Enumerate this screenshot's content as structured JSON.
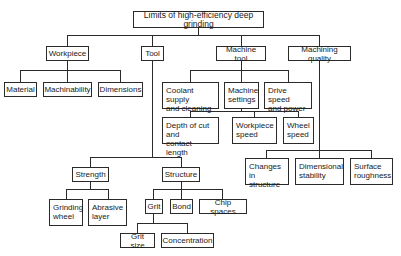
{
  "diagram": {
    "title": "Limits of high-efficiency deep grinding",
    "line_color": "#2a2a2a",
    "nodes": {
      "root": "Limits of high-efficiency deep grinding",
      "workpiece": "Workpiece",
      "tool": "Tool",
      "machine_tool": "Machine tool",
      "machining_quality": "Machining quality",
      "material": "Material",
      "machinability": "Machinability",
      "dimensions": "Dimensions",
      "coolant": "Coolant supply\nand cleaning",
      "machine_settings": "Machine\nsettings",
      "drive_speed": "Drive speed\nand power",
      "depth_of_cut": "Depth of cut and\ncontact length",
      "workpiece_speed": "Workpiece\nspeed",
      "wheel_speed": "Wheel\nspeed",
      "changes_in_structure": "Changes in\nstructure",
      "dimensional_stability": "Dimensional\nstability",
      "surface_roughness": "Surface\nroughness",
      "strength": "Strength",
      "structure": "Structure",
      "grinding_wheel": "Grinding\nwheel",
      "abrasive_layer": "Abrasive\nlayer",
      "grit": "Grit",
      "bond": "Bond",
      "chip_spaces": "Chip spaces",
      "grit_size": "Grit size",
      "concentration": "Concentration"
    },
    "edges": [
      [
        "root",
        "workpiece"
      ],
      [
        "root",
        "tool"
      ],
      [
        "root",
        "machine_tool"
      ],
      [
        "root",
        "machining_quality"
      ],
      [
        "workpiece",
        "material"
      ],
      [
        "workpiece",
        "machinability"
      ],
      [
        "workpiece",
        "dimensions"
      ],
      [
        "machine_tool",
        "coolant"
      ],
      [
        "machine_tool",
        "machine_settings"
      ],
      [
        "machine_tool",
        "drive_speed"
      ],
      [
        "machine_settings",
        "depth_of_cut"
      ],
      [
        "machine_settings",
        "workpiece_speed"
      ],
      [
        "machine_settings",
        "wheel_speed"
      ],
      [
        "machining_quality",
        "changes_in_structure"
      ],
      [
        "machining_quality",
        "dimensional_stability"
      ],
      [
        "machining_quality",
        "surface_roughness"
      ],
      [
        "tool",
        "strength"
      ],
      [
        "tool",
        "structure"
      ],
      [
        "strength",
        "grinding_wheel"
      ],
      [
        "strength",
        "abrasive_layer"
      ],
      [
        "structure",
        "grit"
      ],
      [
        "structure",
        "bond"
      ],
      [
        "structure",
        "chip_spaces"
      ],
      [
        "grit",
        "grit_size"
      ],
      [
        "grit",
        "concentration"
      ]
    ]
  }
}
